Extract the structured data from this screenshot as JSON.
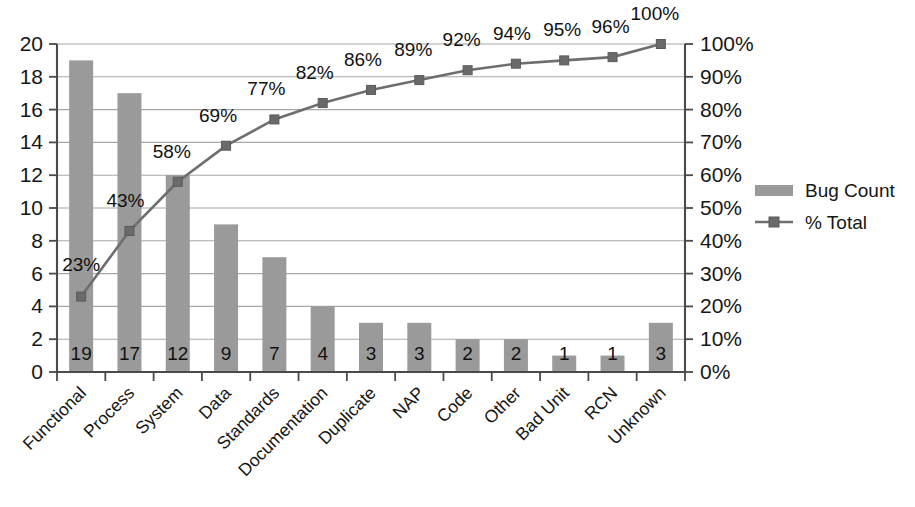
{
  "chart_data": {
    "type": "bar",
    "title": "",
    "subtitle": "",
    "xlabel": "",
    "ylabel": "",
    "y2label": "",
    "categories": [
      "Functional",
      "Process",
      "System",
      "Data",
      "Standards",
      "Documentation",
      "Duplicate",
      "NAP",
      "Code",
      "Other",
      "Bad Unit",
      "RCN",
      "Unknown"
    ],
    "series": [
      {
        "name": "Bug Count",
        "type": "bar",
        "axis": "left",
        "values": [
          19,
          17,
          12,
          9,
          7,
          4,
          3,
          3,
          2,
          2,
          1,
          1,
          3
        ],
        "value_labels": [
          "19",
          "17",
          "12",
          "9",
          "7",
          "4",
          "3",
          "3",
          "2",
          "2",
          "1",
          "1",
          "3"
        ],
        "color": "#9a9a9a"
      },
      {
        "name": "% Total",
        "type": "line",
        "axis": "right",
        "values": [
          23,
          43,
          58,
          69,
          77,
          82,
          86,
          89,
          92,
          94,
          95,
          96,
          100
        ],
        "value_labels": [
          "23%",
          "43%",
          "58%",
          "69%",
          "77%",
          "82%",
          "86%",
          "89%",
          "92%",
          "94%",
          "95%",
          "96%",
          "100%"
        ],
        "color": "#6e6e6e",
        "marker": "square"
      }
    ],
    "ylim": [
      0,
      20
    ],
    "yticks": [
      0,
      2,
      4,
      6,
      8,
      10,
      12,
      14,
      16,
      18,
      20
    ],
    "ytick_labels": [
      "0",
      "2",
      "4",
      "6",
      "8",
      "10",
      "12",
      "14",
      "16",
      "18",
      "20"
    ],
    "y2lim": [
      0,
      100
    ],
    "y2ticks": [
      0,
      10,
      20,
      30,
      40,
      50,
      60,
      70,
      80,
      90,
      100
    ],
    "y2tick_labels": [
      "0%",
      "10%",
      "20%",
      "30%",
      "40%",
      "50%",
      "60%",
      "70%",
      "80%",
      "90%",
      "100%"
    ],
    "grid": true,
    "grid_axis": "y",
    "legend": {
      "position": "right",
      "entries": [
        {
          "label": "Bug Count",
          "marker": "bar-swatch",
          "color": "#9a9a9a"
        },
        {
          "label": "% Total",
          "marker": "line-square",
          "color": "#6e6e6e"
        }
      ]
    },
    "background_color": "#ffffff",
    "gridline_color": "#a8a8a8",
    "axis_color": "#4a4a4a",
    "label_rotation_deg": 45
  }
}
